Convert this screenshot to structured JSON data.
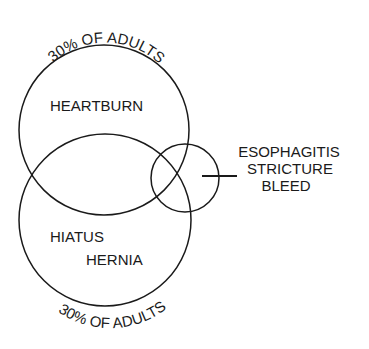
{
  "diagram": {
    "type": "venn",
    "sets": [
      {
        "id": "heartburn",
        "label": "HEARTBURN",
        "annotation": "30% OF ADULTS",
        "annotation_position": "top"
      },
      {
        "id": "hiatus_hernia",
        "label_line1": "HIATUS",
        "label_line2": "HERNIA",
        "annotation": "30% OF ADULTS",
        "annotation_position": "bottom"
      },
      {
        "id": "complications",
        "callout_lines": [
          "ESOPHAGITIS",
          "STRICTURE",
          "BLEED"
        ]
      }
    ],
    "top_annotation": "30% OF ADULTS",
    "bottom_annotation": "30% OF ADULTS",
    "heartburn_label": "HEARTBURN",
    "hiatus_label": "HIATUS",
    "hernia_label": "HERNIA",
    "callout": {
      "line1": "ESOPHAGITIS",
      "line2": "STRICTURE",
      "line3": "BLEED"
    },
    "colors": {
      "stroke": "#1a1a1a",
      "background": "#ffffff"
    }
  }
}
